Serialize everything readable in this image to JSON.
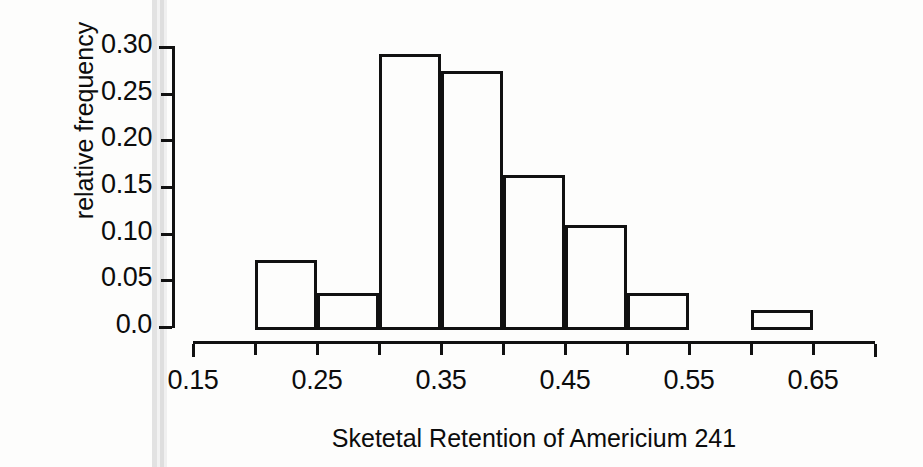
{
  "figure": {
    "kind": "histogram-figure",
    "background_color": "#fdfdfc",
    "ink_color": "#111111",
    "gutter_artifact_color": "#e2e2e2"
  },
  "chart_data": {
    "type": "bar",
    "title": "",
    "xlabel": "Sketetal Retention of Americium 241",
    "ylabel": "relative frequency",
    "grid": false,
    "legend": false,
    "legend_position": "none",
    "bar_style": "hollow-outline",
    "xlim": [
      0.15,
      0.7
    ],
    "ylim": [
      0.0,
      0.3
    ],
    "bin_width": 0.05,
    "bin_edges": [
      0.2,
      0.25,
      0.3,
      0.35,
      0.4,
      0.45,
      0.5,
      0.55,
      0.6,
      0.65
    ],
    "categories": [
      "0.20-0.25",
      "0.25-0.30",
      "0.30-0.35",
      "0.35-0.40",
      "0.40-0.45",
      "0.45-0.50",
      "0.50-0.55",
      "0.55-0.60",
      "0.60-0.65"
    ],
    "values": [
      0.072,
      0.036,
      0.292,
      0.274,
      0.163,
      0.109,
      0.036,
      0.0,
      0.018
    ],
    "x_tick_values": [
      0.15,
      0.2,
      0.25,
      0.3,
      0.35,
      0.4,
      0.45,
      0.5,
      0.55,
      0.6,
      0.65,
      0.7
    ],
    "x_tick_labels": [
      "0.15",
      "",
      "0.25",
      "",
      "0.35",
      "",
      "0.45",
      "",
      "0.55",
      "",
      "0.65",
      ""
    ],
    "y_tick_values": [
      0.0,
      0.05,
      0.1,
      0.15,
      0.2,
      0.25,
      0.3
    ],
    "y_tick_labels": [
      "0.0",
      "0.05",
      "0.10",
      "0.15",
      "0.20",
      "0.25",
      "0.30"
    ]
  },
  "axes": {
    "y_labels": [
      {
        "text": "0.30",
        "value": 0.3
      },
      {
        "text": "0.25",
        "value": 0.25
      },
      {
        "text": "0.20",
        "value": 0.2
      },
      {
        "text": "0.15",
        "value": 0.15
      },
      {
        "text": "0.10",
        "value": 0.1
      },
      {
        "text": "0.05",
        "value": 0.05
      },
      {
        "text": "0.0",
        "value": 0.0
      }
    ],
    "y_title": "relative frequency",
    "x_labels": [
      {
        "text": "0.15",
        "value": 0.15
      },
      {
        "text": "0.25",
        "value": 0.25
      },
      {
        "text": "0.35",
        "value": 0.35
      },
      {
        "text": "0.45",
        "value": 0.45
      },
      {
        "text": "0.55",
        "value": 0.55
      },
      {
        "text": "0.65",
        "value": 0.65
      }
    ],
    "x_title": "Sketetal Retention of Americium 241"
  }
}
